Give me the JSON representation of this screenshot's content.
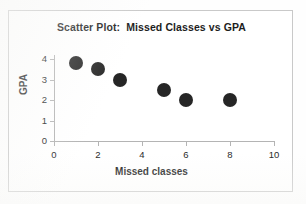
{
  "chart_data": {
    "type": "scatter",
    "title": "Scatter Plot:  Missed Classes vs GPA",
    "xlabel": "Missed classes",
    "ylabel": "GPA",
    "xlim": [
      0,
      10
    ],
    "ylim": [
      0,
      4
    ],
    "xticks": [
      "0",
      "2",
      "4",
      "6",
      "8",
      "10"
    ],
    "xtick_values": [
      0,
      2,
      4,
      6,
      8,
      10
    ],
    "yticks": [
      "0",
      "1",
      "2",
      "3",
      "4"
    ],
    "ytick_values": [
      0,
      1,
      2,
      3,
      4
    ],
    "grid": false,
    "legend": null,
    "marker": {
      "shape": "circle",
      "color": "#262626",
      "size_px": 14
    },
    "points": [
      {
        "x": 1,
        "y": 3.8
      },
      {
        "x": 2,
        "y": 3.5
      },
      {
        "x": 3,
        "y": 3.0
      },
      {
        "x": 5,
        "y": 2.5
      },
      {
        "x": 6,
        "y": 2.0
      },
      {
        "x": 8,
        "y": 2.0
      }
    ],
    "series": [
      {
        "name": "Students",
        "x": [
          1,
          2,
          3,
          5,
          6,
          8
        ],
        "values": [
          3.8,
          3.5,
          3.0,
          2.5,
          2.0,
          2.0
        ]
      }
    ]
  },
  "colors": {
    "marker": "#262626",
    "axis": "#b4b4b4",
    "text": "#1d1d1d",
    "frame": "#c9c9c9",
    "background": "#ffffff"
  }
}
